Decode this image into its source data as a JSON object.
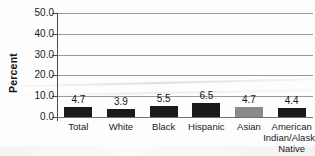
{
  "chart_data": {
    "type": "bar",
    "title": "",
    "xlabel": "",
    "ylabel": "Percent",
    "ylim": [
      0.0,
      50.0
    ],
    "ytick_interval": 10.0,
    "ytick_labels": [
      "50.0",
      "40.0",
      "30.0",
      "20.0",
      "10.0",
      "0.0"
    ],
    "ytick_values": [
      50.0,
      40.0,
      30.0,
      20.0,
      10.0,
      0.0
    ],
    "grid": true,
    "legend": "none",
    "categories": [
      "Total",
      "White",
      "Black",
      "Hispanic",
      "Asian",
      "American Indian/Alaska Native"
    ],
    "category_lines": [
      [
        "Total"
      ],
      [
        "White"
      ],
      [
        "Black"
      ],
      [
        "Hispanic"
      ],
      [
        "Asian"
      ],
      [
        "American",
        "Indian/Alaska",
        "Native"
      ]
    ],
    "values": [
      4.7,
      3.9,
      5.5,
      6.5,
      4.7,
      4.4
    ],
    "value_labels": [
      "4.7",
      "3.9",
      "5.5",
      "6.5",
      "4.7",
      "4.4"
    ],
    "bar_colors": [
      "#1a1a1a",
      "#1a1a1a",
      "#1a1a1a",
      "#1a1a1a",
      "#8a8a8a",
      "#1a1a1a"
    ]
  },
  "colors": {
    "bar_dark": "#1a1a1a",
    "bar_light": "#8a8a8a",
    "gridline": "#9a9a9a",
    "axis": "#4a4a4a",
    "text": "#1b1b1b",
    "background": "#fdfdfd"
  }
}
